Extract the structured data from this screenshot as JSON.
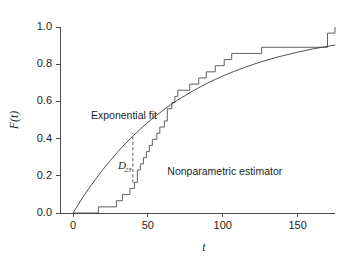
{
  "chart_data": {
    "type": "line",
    "title": "",
    "subtitle": "",
    "xlabel": "t",
    "ylabel": "F(t)",
    "xlim": [
      0,
      175
    ],
    "ylim": [
      0.0,
      1.0
    ],
    "xticks": [
      0,
      50,
      100,
      150
    ],
    "xticklabels": [
      "0",
      "50",
      "100",
      "150"
    ],
    "yticks": [
      0.0,
      0.2,
      0.4,
      0.6,
      0.8,
      1.0
    ],
    "yticklabels": [
      "0.0",
      "0.2",
      "0.4",
      "0.6",
      "0.8",
      "1.0"
    ],
    "grid": false,
    "legend": "none (inline text annotations)",
    "series": [
      {
        "name": "Exponential fit",
        "type": "line",
        "style": "smooth",
        "model": "F(t) = 1 - exp(-t/75)",
        "x": [
          0,
          5,
          10,
          15,
          20,
          25,
          30,
          35,
          40,
          45,
          50,
          55,
          60,
          65,
          70,
          75,
          80,
          85,
          90,
          95,
          100,
          105,
          110,
          115,
          120,
          125,
          130,
          135,
          140,
          145,
          150,
          155,
          160,
          165,
          170,
          175
        ],
        "y": [
          0.0,
          0.065,
          0.125,
          0.181,
          0.234,
          0.283,
          0.33,
          0.373,
          0.414,
          0.451,
          0.487,
          0.52,
          0.551,
          0.58,
          0.608,
          0.632,
          0.656,
          0.678,
          0.699,
          0.718,
          0.736,
          0.753,
          0.769,
          0.784,
          0.798,
          0.811,
          0.823,
          0.835,
          0.845,
          0.855,
          0.865,
          0.873,
          0.882,
          0.889,
          0.896,
          0.903
        ]
      },
      {
        "name": "Nonparametric estimator",
        "type": "step",
        "style": "staircase-right-continuous",
        "jump_times": [
          0,
          17,
          22,
          29,
          33,
          38,
          41,
          43,
          45,
          47,
          49,
          51,
          53,
          56,
          58,
          61,
          63,
          66,
          68,
          70,
          73,
          78,
          84,
          89,
          95,
          101,
          106,
          126,
          170,
          175
        ],
        "jump_values": [
          0.0,
          0.033,
          0.033,
          0.066,
          0.099,
          0.132,
          0.165,
          0.231,
          0.264,
          0.297,
          0.33,
          0.363,
          0.396,
          0.429,
          0.462,
          0.495,
          0.56,
          0.594,
          0.627,
          0.66,
          0.66,
          0.693,
          0.726,
          0.759,
          0.792,
          0.825,
          0.858,
          0.891,
          0.967,
          1.0
        ]
      }
    ],
    "annotations": [
      {
        "name": "exponential-fit-label",
        "text": "Exponential fit",
        "x": 12,
        "y": 0.505
      },
      {
        "name": "nonparametric-estimator-label",
        "text": "Nonparametric estimator",
        "x": 63,
        "y": 0.205
      },
      {
        "name": "d23-statistic-label",
        "text": "D",
        "subscript": "23",
        "x": 30,
        "y": 0.235
      },
      {
        "name": "d23-distance-marker",
        "type": "vertical-dashed-segment",
        "x": 40,
        "y_from": 0.163,
        "y_to": 0.43,
        "meaning": "maximum vertical distance between the two curves"
      }
    ],
    "colors": {
      "background": "#ffffff",
      "axis": "#4a4a4a",
      "smooth_curve": "#3c3c3c",
      "step_curve": "#4f4f4f",
      "text": "#1e1e1e"
    }
  }
}
